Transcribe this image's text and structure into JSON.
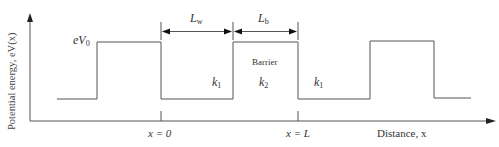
{
  "diagram": {
    "y_axis_label": "Potential energy, eV(x)",
    "x_axis_label": "Distance, x",
    "potential_label": {
      "base": "eV",
      "sub": "0"
    },
    "dimension_labels": {
      "well": {
        "base": "L",
        "sub": "w"
      },
      "barrier": {
        "base": "L",
        "sub": "b"
      }
    },
    "region_labels": {
      "barrier_text": "Barrier",
      "k1_left": {
        "base": "k",
        "sub": "1"
      },
      "k2": {
        "base": "k",
        "sub": "2"
      },
      "k1_right": {
        "base": "k",
        "sub": "1"
      }
    },
    "x_ticks": [
      {
        "label": "x = 0"
      },
      {
        "label": "x = L"
      }
    ],
    "colors": {
      "line": "#555555",
      "text": "#333333",
      "background": "#ffffff"
    }
  }
}
